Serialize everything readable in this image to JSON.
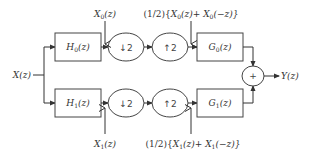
{
  "diagram": {
    "input": {
      "label": "X(z)"
    },
    "output": {
      "label": "Y(z)"
    },
    "top_branch": {
      "analysis_filter": {
        "label": "H0(z)",
        "main": "H",
        "sub": "0",
        "arg": "(z)"
      },
      "downsampler": {
        "label": "↓2"
      },
      "upsampler": {
        "label": "↑2"
      },
      "synthesis_filter": {
        "label": "G0(z)",
        "main": "G",
        "sub": "0",
        "arg": "(z)"
      },
      "signal_after_analysis": {
        "main": "X",
        "sub": "0",
        "arg": "(z)"
      },
      "signal_after_upsampling": {
        "prefix": "(1/2){",
        "t1_main": "X",
        "t1_sub": "0",
        "t1_arg": "(z)+ ",
        "t2_main": "X",
        "t2_sub": "0",
        "t2_arg": "(−z)}"
      }
    },
    "bottom_branch": {
      "analysis_filter": {
        "label": "H1(z)",
        "main": "H",
        "sub": "1",
        "arg": "(z)"
      },
      "downsampler": {
        "label": "↓2"
      },
      "upsampler": {
        "label": "↑2"
      },
      "synthesis_filter": {
        "label": "G1(z)",
        "main": "G",
        "sub": "1",
        "arg": "(z)"
      },
      "signal_after_analysis": {
        "main": "X",
        "sub": "1",
        "arg": "(z)"
      },
      "signal_after_upsampling": {
        "prefix": "(1/2){",
        "t1_main": "X",
        "t1_sub": "1",
        "t1_arg": "(z)+ ",
        "t2_main": "X",
        "t2_sub": "1",
        "t2_arg": "(−z)}"
      }
    },
    "summer": {
      "label": "+"
    },
    "colors": {
      "stroke": "#444444",
      "text": "#333333",
      "background": "#ffffff"
    }
  }
}
